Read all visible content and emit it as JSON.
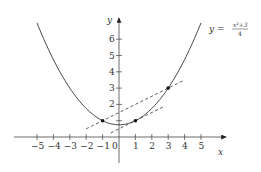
{
  "chart_data": {
    "type": "line",
    "title": "",
    "function_label": "y = (x^2+3)/4",
    "function_label_parts": {
      "lhs": "y =",
      "numerator": "x²+3",
      "denominator": "4"
    },
    "xlabel": "x",
    "ylabel": "y",
    "x_ticks": [
      -5,
      -4,
      -3,
      -2,
      -1,
      0,
      1,
      2,
      3,
      4,
      5
    ],
    "x_tick_labels": [
      "−5",
      "−4",
      "−3",
      "−2",
      "−1",
      "0",
      "1",
      "2",
      "3",
      "4",
      "5"
    ],
    "y_ticks": [
      1,
      2,
      3,
      4,
      5,
      6
    ],
    "y_tick_labels": [
      "",
      "2",
      "3",
      "4",
      "5",
      "6"
    ],
    "xlim": [
      -5.2,
      5.2
    ],
    "ylim": [
      0,
      7
    ],
    "grid": false,
    "series": [
      {
        "name": "y = (x^2+3)/4",
        "style": "solid",
        "x_range": [
          -5,
          5
        ],
        "formula": "(x^2+3)/4"
      },
      {
        "name": "secant through (-1,1) and (3,3)",
        "style": "dashed",
        "x_range": [
          -2,
          4
        ],
        "formula": "0.5*x+1.5"
      },
      {
        "name": "tangent at (1,1)",
        "style": "dashed",
        "x_range": [
          -0.5,
          2.7
        ],
        "formula": "0.5*x+0.5"
      }
    ],
    "points": [
      {
        "x": -1,
        "y": 1
      },
      {
        "x": 1,
        "y": 1
      },
      {
        "x": 3,
        "y": 3
      }
    ]
  }
}
